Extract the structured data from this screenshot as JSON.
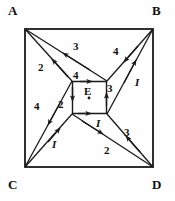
{
  "figure": {
    "corners": [
      {
        "name": "A",
        "label": "A",
        "x": 8,
        "y": 4
      },
      {
        "name": "B",
        "label": "B",
        "x": 152,
        "y": 4
      },
      {
        "name": "C",
        "label": "C",
        "x": 8,
        "y": 178
      },
      {
        "name": "D",
        "label": "D",
        "x": 152,
        "y": 178
      }
    ],
    "center_label": {
      "name": "E",
      "label": "E",
      "x": 84,
      "y": 86
    },
    "edge_labels": [
      {
        "id": "top-3",
        "label": "3",
        "x": 73,
        "y": 41
      },
      {
        "id": "upper-left-2",
        "label": "2",
        "x": 38,
        "y": 62
      },
      {
        "id": "inner-top-4",
        "label": "4",
        "x": 73,
        "y": 70
      },
      {
        "id": "upper-right-4",
        "label": "4",
        "x": 113,
        "y": 46
      },
      {
        "id": "right-1",
        "label": "I",
        "x": 135,
        "y": 77,
        "italic": true
      },
      {
        "id": "inner-right-3",
        "label": "3",
        "x": 107,
        "y": 83
      },
      {
        "id": "left-4",
        "label": "4",
        "x": 34,
        "y": 101
      },
      {
        "id": "inner-left-2",
        "label": "2",
        "x": 58,
        "y": 99
      },
      {
        "id": "lower-left-1",
        "label": "I",
        "x": 52,
        "y": 139,
        "italic": true
      },
      {
        "id": "inner-bottom-1",
        "label": "I",
        "x": 96,
        "y": 118,
        "italic": true
      },
      {
        "id": "lower-right-3",
        "label": "3",
        "x": 124,
        "y": 127
      },
      {
        "id": "bottom-2",
        "label": "2",
        "x": 104,
        "y": 145
      }
    ],
    "geometry": {
      "outer_square": {
        "x1": 25,
        "y1": 29,
        "x2": 153,
        "y2": 167
      },
      "inner_square": {
        "x1": 72,
        "y1": 81,
        "x2": 107,
        "y2": 114
      },
      "center_dot": {
        "x": 89,
        "y": 98
      },
      "stroke_color": "#1a1a1a"
    }
  }
}
